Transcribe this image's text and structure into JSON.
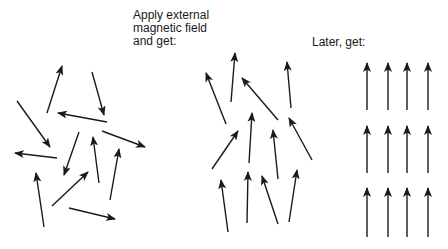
{
  "labels": {
    "apply_line1": "Apply external",
    "apply_line2": "magnetic field",
    "apply_line3": "and get:",
    "later": "Later, get:"
  },
  "panels": [
    {
      "name": "random",
      "description": "Randomly oriented magnetic domains"
    },
    {
      "name": "partially-aligned",
      "description": "Domains partially aligned with applied field"
    },
    {
      "name": "aligned",
      "description": "All domains aligned with field"
    }
  ],
  "colors": {
    "arrow": "#1a1a1a",
    "background": "#ffffff"
  }
}
